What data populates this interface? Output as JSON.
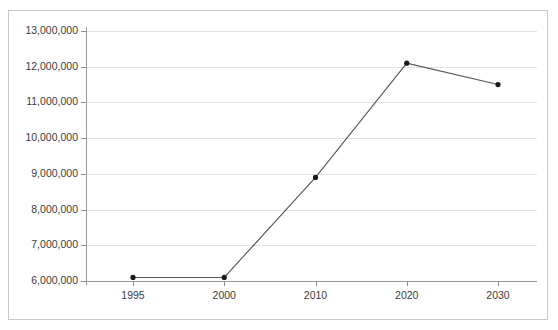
{
  "chart_data": {
    "type": "line",
    "title": "",
    "subtitle": "",
    "xlabel": "",
    "ylabel": "",
    "categories": [
      "1995",
      "2000",
      "2010",
      "2020",
      "2030"
    ],
    "x": [
      1995,
      2000,
      2010,
      2020,
      2030
    ],
    "values": [
      6100000,
      6100000,
      8900000,
      12100000,
      11500000
    ],
    "series": [
      {
        "name": "",
        "values": [
          6100000,
          6100000,
          8900000,
          12100000,
          11500000
        ]
      }
    ],
    "ylim": [
      6000000,
      13000000
    ],
    "ytick_values": [
      6000000,
      7000000,
      8000000,
      9000000,
      10000000,
      11000000,
      12000000,
      13000000
    ],
    "ytick_labels": [
      "6,000,000",
      "7,000,000",
      "8,000,000",
      "9,000,000",
      "10,000,000",
      "11,000,000",
      "12,000,000",
      "13,000,000"
    ],
    "xtick_labels": [
      "1995",
      "2000",
      "2010",
      "2020",
      "2030"
    ],
    "grid": true,
    "grid_axis": "y",
    "legend": false,
    "legend_position": "none",
    "marker": "circle",
    "annotations": [],
    "colors": {
      "line": "#555555",
      "marker": "#1a1a1a",
      "gridline": "#e3e3e3",
      "axis": "#9a9a9a",
      "frame": "#c9c9c9",
      "text": "#3b3b3b",
      "background": "#ffffff"
    }
  }
}
